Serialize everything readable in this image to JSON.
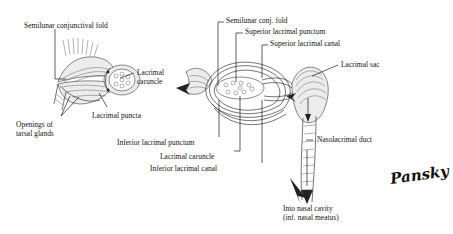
{
  "figure": {
    "signature": "Pansky"
  },
  "left_diagram": {
    "name": "medial-canthus-surface-view",
    "labels": [
      {
        "id": "semilunar-conjunctival-fold",
        "text": "Semilunar conjunctival fold"
      },
      {
        "id": "lacrimal-caruncle",
        "text": "Lacrimal\ncaruncle"
      },
      {
        "id": "lacrimal-puncta",
        "text": "Lacrimal puncta"
      },
      {
        "id": "openings-of-tarsal-glands",
        "text": "Openings of\ntarsal glands"
      }
    ]
  },
  "right_diagram": {
    "name": "lacrimal-drainage-cutaway",
    "labels": [
      {
        "id": "semilunar-conj-fold",
        "text": "Semilunar conj. fold"
      },
      {
        "id": "superior-lacrimal-punctum",
        "text": "Superior lacrimal punctum"
      },
      {
        "id": "superior-lacrimal-canal",
        "text": "Superior lacrimal canal"
      },
      {
        "id": "lacrimal-sac",
        "text": "Lacrimal sac"
      },
      {
        "id": "nasolacrimal-duct",
        "text": "Nasolacrimal duct"
      },
      {
        "id": "inferior-lacrimal-punctum",
        "text": "Inferior lacrimal punctum"
      },
      {
        "id": "lacrimal-caruncle",
        "text": "Lacrimal caruncle"
      },
      {
        "id": "inferior-lacrimal-canal",
        "text": "Inferior lacrimal canal"
      },
      {
        "id": "into-nasal-cavity",
        "text": "Into nasal cavity\n(inf. nasal meatus)"
      }
    ]
  },
  "colors": {
    "background": "#ffffff",
    "ink": "#1a1a1a",
    "line": "#1b1b1b",
    "shade": "#ececec"
  }
}
